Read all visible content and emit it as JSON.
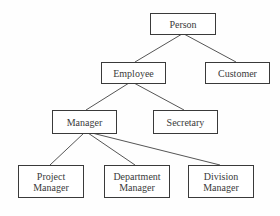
{
  "diagram": {
    "type": "class-hierarchy",
    "nodes": {
      "person": {
        "label": "Person"
      },
      "employee": {
        "label": "Employee"
      },
      "customer": {
        "label": "Customer"
      },
      "manager": {
        "label": "Manager"
      },
      "secretary": {
        "label": "Secretary"
      },
      "project_manager": {
        "label_line1": "Project",
        "label_line2": "Manager"
      },
      "department_manager": {
        "label_line1": "Department",
        "label_line2": "Manager"
      },
      "division_manager": {
        "label_line1": "Division",
        "label_line2": "Manager"
      }
    },
    "edges": [
      {
        "from": "Person",
        "to": "Employee"
      },
      {
        "from": "Person",
        "to": "Customer"
      },
      {
        "from": "Employee",
        "to": "Manager"
      },
      {
        "from": "Employee",
        "to": "Secretary"
      },
      {
        "from": "Manager",
        "to": "Project Manager"
      },
      {
        "from": "Manager",
        "to": "Department Manager"
      },
      {
        "from": "Manager",
        "to": "Division Manager"
      }
    ],
    "colors": {
      "border": "#3a3a3a",
      "line": "#555555",
      "text": "#3a3a3a",
      "background": "#ffffff"
    }
  }
}
